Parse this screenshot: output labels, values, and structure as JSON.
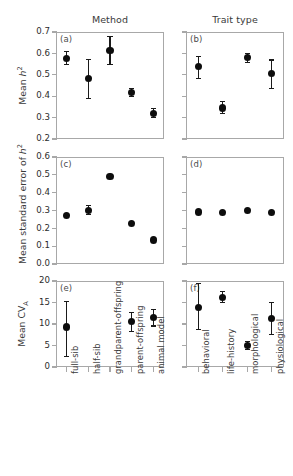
{
  "columns": [
    {
      "key": "method",
      "title": "Method",
      "categories": [
        "full-sib",
        "half-sib",
        "grandparent-offspring",
        "parent-offspring",
        "animal model"
      ]
    },
    {
      "key": "trait",
      "title": "Trait type",
      "categories": [
        "behavioral",
        "life-history",
        "morphological",
        "physiological"
      ]
    }
  ],
  "axis_titles": {
    "row1": "Mean h²",
    "row2": "Mean standard error of h²",
    "row3": "Mean CVₐ"
  },
  "panel_tags": {
    "a": "(a)",
    "b": "(b)",
    "c": "(c)",
    "d": "(d)",
    "e": "(e)",
    "f": "(f)"
  },
  "colors": {
    "marker": "#0d0d0d",
    "axis": "#a8a8a8",
    "text": "#231f20"
  },
  "chart_data": [
    {
      "type": "scatter",
      "panel": "(a)",
      "title": "Method",
      "ylabel": "Mean h^2",
      "xlabel": "",
      "ylim": [
        0.2,
        0.7
      ],
      "yticks": [
        0.2,
        0.3,
        0.4,
        0.5,
        0.6,
        0.7
      ],
      "ytick_labels": [
        "0.2",
        "0.3",
        "0.4",
        "0.5",
        "0.6",
        "0.7"
      ],
      "grid": false,
      "legend": "none",
      "categories": [
        "full-sib",
        "half-sib",
        "grandparent-offspring",
        "parent-offspring",
        "animal model"
      ],
      "values": [
        0.578,
        0.482,
        0.615,
        0.417,
        0.321
      ],
      "err_low": [
        0.545,
        0.387,
        0.547,
        0.394,
        0.297
      ],
      "err_high": [
        0.611,
        0.575,
        0.68,
        0.44,
        0.345
      ]
    },
    {
      "type": "scatter",
      "panel": "(b)",
      "title": "Trait type",
      "ylabel": "Mean h^2",
      "xlabel": "",
      "ylim": [
        0.2,
        0.7
      ],
      "yticks": [
        0.2,
        0.3,
        0.4,
        0.5,
        0.6,
        0.7
      ],
      "ytick_labels": [
        "0.2",
        "0.3",
        "0.4",
        "0.5",
        "0.6",
        "0.7"
      ],
      "grid": false,
      "legend": "none",
      "categories": [
        "behavioral",
        "life-history",
        "morphological",
        "physiological"
      ],
      "values": [
        0.538,
        0.345,
        0.58,
        0.505
      ],
      "err_low": [
        0.478,
        0.316,
        0.556,
        0.432
      ],
      "err_high": [
        0.588,
        0.378,
        0.604,
        0.572
      ]
    },
    {
      "type": "scatter",
      "panel": "(c)",
      "title": "",
      "ylabel": "Mean standard error of h^2",
      "xlabel": "",
      "ylim": [
        0.0,
        0.6
      ],
      "yticks": [
        0.0,
        0.1,
        0.2,
        0.3,
        0.4,
        0.5,
        0.6
      ],
      "ytick_labels": [
        "0.0",
        "0.1",
        "0.2",
        "0.3",
        "0.4",
        "0.5",
        "0.6"
      ],
      "grid": false,
      "legend": "none",
      "categories": [
        "full-sib",
        "half-sib",
        "grandparent-offspring",
        "parent-offspring",
        "animal model"
      ],
      "values": [
        0.27,
        0.302,
        0.49,
        0.225,
        0.135
      ],
      "err_low": [
        0.259,
        0.276,
        0.475,
        0.216,
        0.126
      ],
      "err_high": [
        0.281,
        0.329,
        0.505,
        0.234,
        0.144
      ]
    },
    {
      "type": "scatter",
      "panel": "(d)",
      "title": "",
      "ylabel": "Mean standard error of h^2",
      "xlabel": "",
      "ylim": [
        0.0,
        0.6
      ],
      "yticks": [
        0.0,
        0.1,
        0.2,
        0.3,
        0.4,
        0.5,
        0.6
      ],
      "ytick_labels": [
        "0.0",
        "0.1",
        "0.2",
        "0.3",
        "0.4",
        "0.5",
        "0.6"
      ],
      "grid": false,
      "legend": "none",
      "categories": [
        "behavioral",
        "life-history",
        "morphological",
        "physiological"
      ],
      "values": [
        0.292,
        0.288,
        0.3,
        0.29
      ],
      "err_low": [
        0.276,
        0.28,
        0.293,
        0.275
      ],
      "err_high": [
        0.308,
        0.296,
        0.307,
        0.305
      ]
    },
    {
      "type": "scatter",
      "panel": "(e)",
      "title": "",
      "ylabel": "Mean CV_A",
      "xlabel": "",
      "ylim": [
        0,
        20
      ],
      "yticks": [
        0,
        5,
        10,
        15,
        20
      ],
      "ytick_labels": [
        "0",
        "5",
        "10",
        "15",
        "20"
      ],
      "grid": false,
      "legend": "none",
      "categories": [
        "full-sib",
        "half-sib",
        "grandparent-offspring",
        "parent-offspring",
        "animal model"
      ],
      "values": [
        9.3,
        null,
        null,
        10.6,
        11.5
      ],
      "err_low": [
        2.4,
        null,
        null,
        8.2,
        9.4
      ],
      "err_high": [
        15.4,
        null,
        null,
        12.9,
        13.6
      ]
    },
    {
      "type": "scatter",
      "panel": "(f)",
      "title": "",
      "ylabel": "Mean CV_A",
      "xlabel": "",
      "ylim": [
        0,
        20
      ],
      "yticks": [
        0,
        5,
        10,
        15,
        20
      ],
      "ytick_labels": [
        "0",
        "5",
        "10",
        "15",
        "20"
      ],
      "grid": false,
      "legend": "none",
      "categories": [
        "behavioral",
        "life-history",
        "morphological",
        "physiological"
      ],
      "values": [
        13.8,
        16.2,
        5.0,
        11.3
      ],
      "err_low": [
        8.6,
        14.8,
        4.0,
        7.5
      ],
      "err_high": [
        19.6,
        17.7,
        6.1,
        15.1
      ]
    }
  ]
}
